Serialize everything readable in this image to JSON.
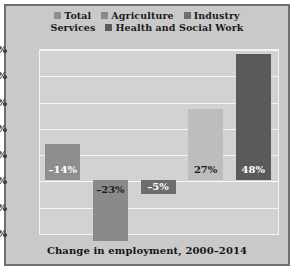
{
  "figure": {
    "caption": "Change in employment, 2000–2014",
    "frame_color": "#6f6f6f",
    "background_color": "#c9c9c9",
    "plot_background_color": "#d2d2d2",
    "gridline_color": "#f4f4f4"
  },
  "legend": {
    "rows": [
      [
        {
          "label": "Total",
          "color": "#8e8e8e",
          "swatch": true
        },
        {
          "label": "Agriculture",
          "color": "#8a8a8a",
          "swatch": true
        },
        {
          "label": "Industry",
          "color": "#6d6d6d",
          "swatch": true
        }
      ],
      [
        {
          "label": "Services",
          "color": "#bdbdbd",
          "swatch": false
        },
        {
          "label": "Health and Social Work",
          "color": "#5a5a5a",
          "swatch": true
        }
      ]
    ]
  },
  "chart_data": {
    "type": "bar",
    "title": "Change in employment, 2000–2014",
    "xlabel": "",
    "ylabel": "",
    "ylim": [
      -20,
      50
    ],
    "grid": true,
    "legend_position": "top",
    "categories": [
      "Total",
      "Agriculture",
      "Industry",
      "Services",
      "Health and Social Work"
    ],
    "values": [
      14,
      -23,
      -5,
      27,
      48
    ],
    "data_labels": [
      "–14%",
      "–23%",
      "–5%",
      "27%",
      "48%"
    ],
    "bar_colors": [
      "#8e8e8e",
      "#8a8a8a",
      "#6d6d6d",
      "#bdbdbd",
      "#5a5a5a"
    ],
    "label_colors": [
      "#ffffff",
      "#1c1c1c",
      "#ffffff",
      "#1c1c1c",
      "#ffffff"
    ],
    "yticks": [
      50,
      40,
      30,
      20,
      10,
      0,
      -10,
      -20
    ],
    "ytick_labels": [
      "50%",
      "40%",
      "30%",
      "20%",
      "10%",
      "0%",
      "–10%",
      "–20%"
    ]
  }
}
